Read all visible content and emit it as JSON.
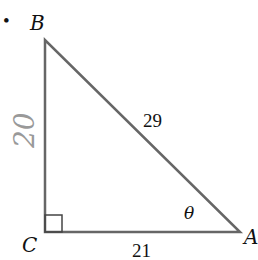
{
  "diagram": {
    "type": "right-triangle",
    "bullet": "•",
    "vertices": {
      "B": {
        "label": "B"
      },
      "C": {
        "label": "C"
      },
      "A": {
        "label": "A"
      }
    },
    "sides": {
      "hypotenuse": {
        "label": "29"
      },
      "base": {
        "label": "21"
      },
      "vertical_handwritten": {
        "label": "20"
      }
    },
    "angle": {
      "label": "θ",
      "at": "A"
    },
    "right_angle_at": "C",
    "colors": {
      "line": "#666666",
      "handwriting": "#999999",
      "text": "#111111"
    }
  }
}
